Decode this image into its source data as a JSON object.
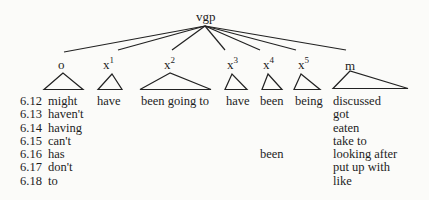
{
  "diagram": {
    "root": {
      "label": "vgp"
    },
    "children": [
      {
        "id": "o",
        "label": "o",
        "sup": "",
        "terminal": [
          "might",
          "haven't",
          "having",
          "can't",
          "has",
          "don't",
          "to"
        ]
      },
      {
        "id": "x1",
        "label": "x",
        "sup": "1",
        "terminal": [
          "have"
        ]
      },
      {
        "id": "x2",
        "label": "x",
        "sup": "2",
        "terminal": [
          "been going to"
        ]
      },
      {
        "id": "x3",
        "label": "x",
        "sup": "3",
        "terminal": [
          "have"
        ]
      },
      {
        "id": "x4",
        "label": "x",
        "sup": "4",
        "terminal": [
          "been",
          "",
          "",
          "",
          "been"
        ]
      },
      {
        "id": "x5",
        "label": "x",
        "sup": "5",
        "terminal": [
          "being"
        ]
      },
      {
        "id": "m",
        "label": "m",
        "sup": "",
        "terminal": [
          "discussed",
          "got",
          "eaten",
          "take to",
          "looking after",
          "put up with",
          "like"
        ]
      }
    ],
    "example_numbers": [
      "6.12",
      "6.13",
      "6.14",
      "6.15",
      "6.16",
      "6.17",
      "6.18"
    ]
  }
}
